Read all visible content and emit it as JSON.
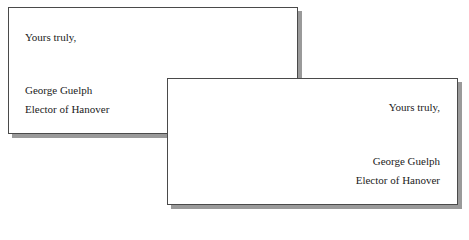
{
  "cards": [
    {
      "alignment": "left",
      "salutation": "Yours truly,",
      "name": "George Guelph",
      "title": "Elector of Hanover"
    },
    {
      "alignment": "right",
      "salutation": "Yours truly,",
      "name": "George Guelph",
      "title": "Elector of Hanover"
    }
  ],
  "colors": {
    "border": "#4a4a4a",
    "shadow": "#9a9a9a",
    "text": "#222222"
  }
}
